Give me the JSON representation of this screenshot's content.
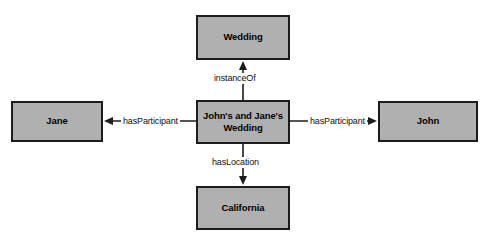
{
  "diagram": {
    "type": "semantic-network-graph",
    "background_color": "#ffffff",
    "node_fill_color": "#b0b0b0",
    "node_border_color": "#1c1c1c",
    "edge_color": "#1c1c1c",
    "nodes": [
      {
        "id": "wedding",
        "label": "Wedding",
        "role": "class"
      },
      {
        "id": "instance",
        "label": "John's and Jane's Wedding",
        "line1": "John's and Jane's",
        "line2": "Wedding",
        "role": "instance"
      },
      {
        "id": "jane",
        "label": "Jane",
        "role": "instance"
      },
      {
        "id": "john",
        "label": "John",
        "role": "instance"
      },
      {
        "id": "california",
        "label": "California",
        "role": "instance"
      }
    ],
    "edges": [
      {
        "id": "instanceof",
        "label": "instanceOf",
        "from": "instance",
        "to": "wedding",
        "direction": "up"
      },
      {
        "id": "haslocation",
        "label": "hasLocation",
        "from": "instance",
        "to": "california",
        "direction": "down"
      },
      {
        "id": "hasparticipant-left",
        "label": "hasParticipant",
        "from": "instance",
        "to": "jane",
        "direction": "left"
      },
      {
        "id": "hasparticipant-right",
        "label": "hasParticipant",
        "from": "instance",
        "to": "john",
        "direction": "right"
      }
    ]
  }
}
